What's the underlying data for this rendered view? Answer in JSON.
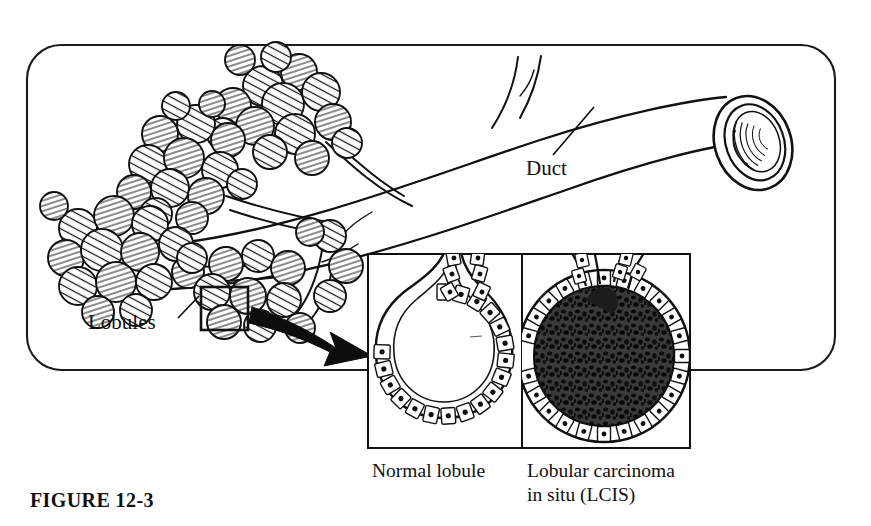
{
  "figure": {
    "caption": "FIGURE 12-3",
    "frame_color": "#1a1a1a",
    "ink_color": "#111111",
    "background_color": "#ffffff"
  },
  "labels": {
    "duct": "Duct",
    "lobules": "Lobules"
  },
  "insets": {
    "normal": {
      "caption": "Normal lobule",
      "description": "Hollow acinus lined by a single layer of cuboidal epithelial cells"
    },
    "lcis": {
      "caption_line1": "Lobular carcinoma",
      "caption_line2": "in situ (LCIS)",
      "description": "Acinus distended and completely filled with dark neoplastic cells"
    }
  },
  "anatomy": {
    "lobule_clusters": 4,
    "acini_per_cluster": 14,
    "duct_branches": 1,
    "selection_box_present": true,
    "arrow_present": true
  }
}
